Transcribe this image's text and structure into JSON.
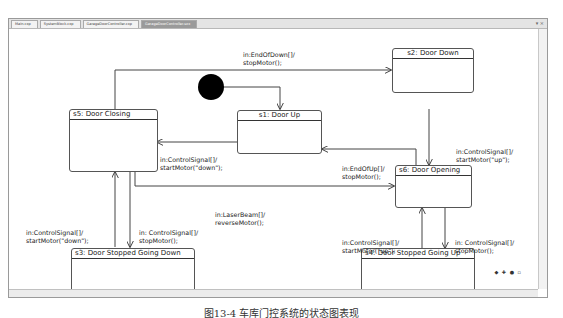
{
  "tabs": [
    {
      "label": "Main.cxp",
      "active": false
    },
    {
      "label": "SystemBlock.cxp",
      "active": false
    },
    {
      "label": "GarageDoorController.cxp",
      "active": false
    },
    {
      "label": "GarageDoorController.sxx",
      "active": true
    }
  ],
  "window_controls": "▾ ×",
  "states": {
    "s1": "s1: Door Up",
    "s2": "s2: Door Down",
    "s3": "s3: Door Stopped Going Down",
    "s4": "s4: Door Stopped Going Up",
    "s5": "s5: Door Closing",
    "s6": "s6: Door Opening"
  },
  "transitions": {
    "s5_s2": [
      "in:EndOfDown[]/",
      "stopMotor();"
    ],
    "s2_s6": [
      "in:ControlSignal[]/",
      "startMotor(\"up\");"
    ],
    "s1_s5": [
      "in:ControlSignal[]/",
      "startMotor(\"down\");"
    ],
    "s6_s1": [
      "in:EndOfUp[]/",
      "stopMotor();"
    ],
    "s5_s6": [
      "in:LaserBeam[]/",
      "reverseMotor();"
    ],
    "s3_s5": [
      "in:ControlSignal[]/",
      "startMotor(\"down\");"
    ],
    "s5_s3": [
      "in: ControlSignal[]/",
      "stopMotor();"
    ],
    "s4_s6": [
      "in:ControlSignal[]/",
      "startMotor(\"up\");"
    ],
    "s6_s4": [
      "in: ControlSignal[]/",
      "stopMotor();"
    ]
  },
  "zoom_controls": "◆ ✚ ● ▫",
  "caption": "图13-4  车库门控系统的状态图表现"
}
